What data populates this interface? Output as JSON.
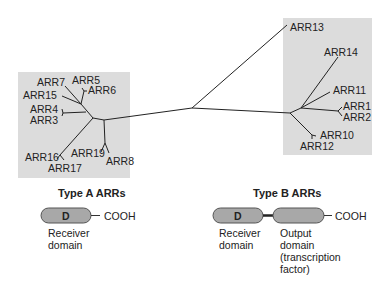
{
  "diagram": {
    "type": "phylogenetic-tree",
    "colors": {
      "box": "#dcdcdc",
      "line": "#222222",
      "domain_fill": "#a8a8a8",
      "domain_stroke": "#555555"
    },
    "groups": {
      "type_a": {
        "title": "Type A ARRs",
        "members": [
          "ARR7",
          "ARR5",
          "ARR15",
          "ARR6",
          "ARR4",
          "ARR3",
          "ARR16",
          "ARR19",
          "ARR17",
          "ARR8"
        ]
      },
      "type_b": {
        "title": "Type B ARRs",
        "members": [
          "ARR13",
          "ARR14",
          "ARR11",
          "ARR1",
          "ARR2",
          "ARR10",
          "ARR12"
        ]
      }
    },
    "labels": {
      "arr7": "ARR7",
      "arr5": "ARR5",
      "arr15": "ARR15",
      "arr6": "ARR6",
      "arr4": "ARR4",
      "arr3": "ARR3",
      "arr16": "ARR16",
      "arr19": "ARR19",
      "arr17": "ARR17",
      "arr8": "ARR8",
      "arr13": "ARR13",
      "arr14": "ARR14",
      "arr11": "ARR11",
      "arr1": "ARR1",
      "arr2": "ARR2",
      "arr10": "ARR10",
      "arr12": "ARR12"
    },
    "type_a_domain": {
      "domain_letter": "D",
      "terminus": "COOH",
      "receiver_line1": "Receiver",
      "receiver_line2": "domain"
    },
    "type_b_domain": {
      "domain_letter": "D",
      "terminus": "COOH",
      "receiver_line1": "Receiver",
      "receiver_line2": "domain",
      "output_line1": "Output",
      "output_line2": "domain",
      "output_line3": "(transcription",
      "output_line4": "factor)"
    }
  }
}
